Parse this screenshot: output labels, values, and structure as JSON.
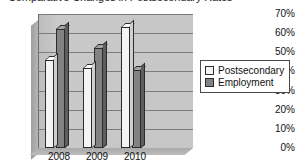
{
  "chart_data": {
    "type": "bar",
    "title": "Comparative Changes in Postsecondary Rates",
    "xlabel": "",
    "ylabel": "",
    "categories": [
      "2008",
      "2009",
      "2010"
    ],
    "series": [
      {
        "name": "Postsecondary",
        "values": [
          46,
          42,
          63
        ],
        "color": "#f4f4f4"
      },
      {
        "name": "Employment",
        "values": [
          62,
          52,
          41
        ],
        "color": "#828282"
      }
    ],
    "ylim": [
      0,
      70
    ],
    "ytick_labels": [
      "70%",
      "60%",
      "50%",
      "40%",
      "30%",
      "20%",
      "10%",
      "0%"
    ],
    "ytick_values": [
      70,
      60,
      50,
      40,
      30,
      20,
      10,
      0
    ],
    "grid": true,
    "legend_position": "right",
    "style": "3d-column",
    "plot_background": "#c4c4c4",
    "gridline_color": "#7d7d7d"
  }
}
